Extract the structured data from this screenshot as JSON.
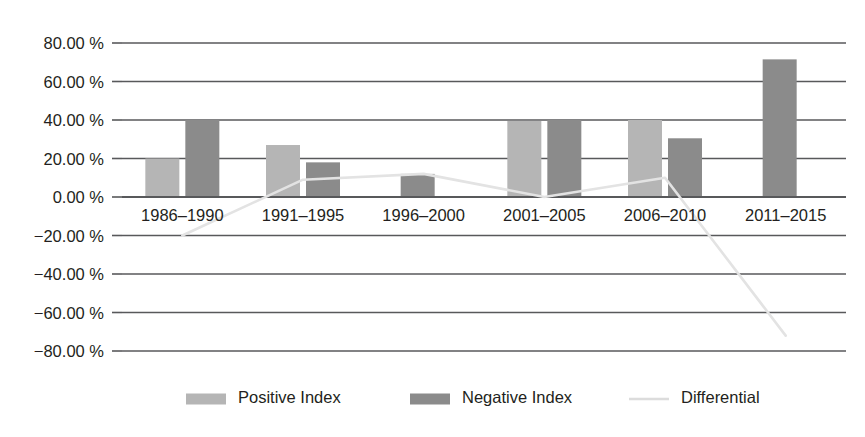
{
  "chart_data": {
    "type": "bar",
    "title": "",
    "subtitle": "",
    "xlabel": "",
    "ylabel": "",
    "categories": [
      "1986–1990",
      "1991–1995",
      "1996–2000",
      "2001–2005",
      "2006–2010",
      "2011–2015"
    ],
    "ylim": [
      -80,
      80
    ],
    "ytick_labels": [
      "80.00 %",
      "60.00 %",
      "40.00 %",
      "20.00 %",
      "0.00 %",
      "−20.00 %",
      "−40.00 %",
      "−60.00 %",
      "−80.00 %"
    ],
    "ytick_values": [
      80,
      60,
      40,
      20,
      0,
      -20,
      -40,
      -60,
      -80
    ],
    "grid": true,
    "legend_position": "bottom",
    "series": [
      {
        "name": "Positive Index",
        "type": "bar",
        "color": "#b5b5b5",
        "values": [
          20.0,
          27.0,
          null,
          39.5,
          40.0,
          null
        ]
      },
      {
        "name": "Negative Index",
        "type": "bar",
        "color": "#8b8b8b",
        "values": [
          40.0,
          18.0,
          12.0,
          40.0,
          30.5,
          71.5
        ]
      },
      {
        "name": "Differential",
        "type": "line",
        "color": "#e3e3e3",
        "values": [
          -20.0,
          9.0,
          12.0,
          0.0,
          10.0,
          -72.0
        ]
      }
    ]
  },
  "legend": {
    "items": [
      {
        "label": "Positive Index",
        "marker": "bar-swatch-light",
        "color": "#b5b5b5"
      },
      {
        "label": "Negative Index",
        "marker": "bar-swatch-dark",
        "color": "#8b8b8b"
      },
      {
        "label": "Differential",
        "marker": "line-swatch",
        "color": "#dcdcdc"
      }
    ]
  },
  "colors": {
    "positive_bar": "#b5b5b5",
    "negative_bar": "#8b8b8b",
    "differential_line": "#e0e0e0",
    "axis": "#58595b",
    "text": "#231f20",
    "background": "#ffffff"
  }
}
